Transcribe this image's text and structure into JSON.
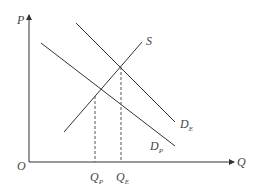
{
  "diagram": {
    "axes": {
      "y_label": "P",
      "x_label": "Q",
      "origin_label": "O"
    },
    "curves": [
      {
        "id": "S",
        "label": "S",
        "sub": ""
      },
      {
        "id": "D_E",
        "label": "D",
        "sub": "E"
      },
      {
        "id": "D_P",
        "label": "D",
        "sub": "P"
      }
    ],
    "quantity_marks": [
      {
        "label": "Q",
        "sub": "P"
      },
      {
        "label": "Q",
        "sub": "E"
      }
    ],
    "colors": {
      "line": "#333333",
      "dash": "#555555"
    }
  }
}
